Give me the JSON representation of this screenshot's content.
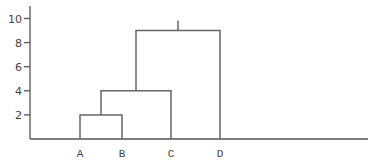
{
  "chart_data": {
    "type": "dendrogram",
    "title": "",
    "xlabel": "",
    "ylabel": "",
    "ylim": [
      0,
      10.5
    ],
    "yticks": [
      2,
      4,
      6,
      8,
      10
    ],
    "ytick_labels": [
      "2",
      "4",
      "6",
      "8",
      "10"
    ],
    "grid": false,
    "legend": null,
    "leaves": [
      "A",
      "B",
      "C",
      "D"
    ],
    "merges": [
      {
        "left": "A",
        "right": "B",
        "height": 2
      },
      {
        "left": "AB",
        "right": "C",
        "height": 4
      },
      {
        "left": "ABC",
        "right": "D",
        "height": 9
      }
    ],
    "root_stem_top": 10,
    "colors": {
      "lines": "#666666",
      "axis": "#555555",
      "text": "#444444"
    }
  }
}
